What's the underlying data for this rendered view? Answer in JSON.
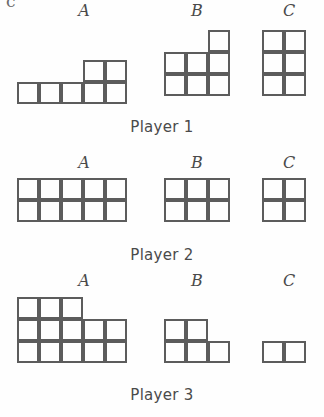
{
  "figure": {
    "top_clipped_glyph": "c",
    "cell_size": 22,
    "stroke_color": "#5c5c5c",
    "background_color": "#fefefe",
    "text_color": "#4a4a4a"
  },
  "shape_labels": [
    "A",
    "B",
    "C"
  ],
  "players": [
    {
      "caption": "Player 1",
      "caption_y": 118,
      "label_y": 2,
      "shapes": [
        {
          "label": "A",
          "label_x": 72,
          "x": 17,
          "y": 38,
          "cols": 5,
          "rows": 3,
          "cell_count": 7,
          "grid": [
            [
              0,
              0,
              0,
              0,
              0
            ],
            [
              0,
              0,
              0,
              1,
              1
            ],
            [
              1,
              1,
              1,
              1,
              1
            ]
          ]
        },
        {
          "label": "B",
          "label_x": 185,
          "x": 164,
          "y": 30,
          "cols": 3,
          "rows": 3,
          "cell_count": 7,
          "grid": [
            [
              0,
              0,
              1
            ],
            [
              1,
              1,
              1
            ],
            [
              1,
              1,
              1
            ]
          ]
        },
        {
          "label": "C",
          "label_x": 277,
          "x": 262,
          "y": 30,
          "cols": 2,
          "rows": 3,
          "cell_count": 6,
          "grid": [
            [
              1,
              1
            ],
            [
              1,
              1
            ],
            [
              1,
              1
            ]
          ]
        }
      ]
    },
    {
      "caption": "Player 2",
      "caption_y": 246,
      "label_y": 154,
      "shapes": [
        {
          "label": "A",
          "label_x": 72,
          "x": 17,
          "y": 178,
          "cols": 5,
          "rows": 2,
          "cell_count": 10,
          "grid": [
            [
              1,
              1,
              1,
              1,
              1
            ],
            [
              1,
              1,
              1,
              1,
              1
            ]
          ]
        },
        {
          "label": "B",
          "label_x": 185,
          "x": 164,
          "y": 178,
          "cols": 3,
          "rows": 2,
          "cell_count": 6,
          "grid": [
            [
              1,
              1,
              1
            ],
            [
              1,
              1,
              1
            ]
          ]
        },
        {
          "label": "C",
          "label_x": 277,
          "x": 262,
          "y": 178,
          "cols": 2,
          "rows": 2,
          "cell_count": 4,
          "grid": [
            [
              1,
              1
            ],
            [
              1,
              1
            ]
          ]
        }
      ]
    },
    {
      "caption": "Player 3",
      "caption_y": 386,
      "label_y": 272,
      "shapes": [
        {
          "label": "A",
          "label_x": 72,
          "x": 17,
          "y": 297,
          "cols": 5,
          "rows": 3,
          "cell_count": 13,
          "grid": [
            [
              1,
              1,
              1,
              0,
              0
            ],
            [
              1,
              1,
              1,
              1,
              1
            ],
            [
              1,
              1,
              1,
              1,
              1
            ]
          ]
        },
        {
          "label": "B",
          "label_x": 185,
          "x": 164,
          "y": 319,
          "cols": 3,
          "rows": 2,
          "cell_count": 5,
          "grid": [
            [
              1,
              1,
              0
            ],
            [
              1,
              1,
              1
            ]
          ]
        },
        {
          "label": "C",
          "label_x": 277,
          "x": 262,
          "y": 341,
          "cols": 2,
          "rows": 1,
          "cell_count": 2,
          "grid": [
            [
              1,
              1
            ]
          ]
        }
      ]
    }
  ]
}
